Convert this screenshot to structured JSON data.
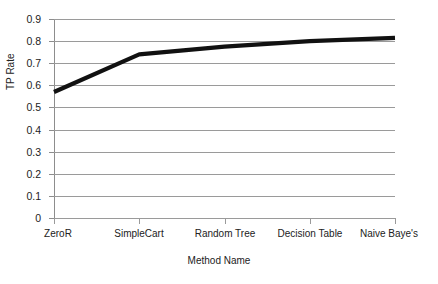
{
  "chart_data": {
    "type": "line",
    "title": "",
    "xlabel": "Method Name",
    "ylabel": "TP Rate",
    "categories": [
      "ZeroR",
      "SimpleCart",
      "Random Tree",
      "Decision Table",
      "Naive Baye's"
    ],
    "values": [
      0.57,
      0.74,
      0.775,
      0.8,
      0.815
    ],
    "ylim": [
      0,
      0.9
    ],
    "yticks": [
      "0",
      "0.1",
      "0.2",
      "0.3",
      "0.4",
      "0.5",
      "0.6",
      "0.7",
      "0.8",
      "0.9"
    ],
    "ytick_values": [
      0,
      0.1,
      0.2,
      0.3,
      0.4,
      0.5,
      0.6,
      0.7,
      0.8,
      0.9
    ],
    "grid": true,
    "legend": false,
    "series": [
      {
        "name": "TP Rate",
        "color": "#111111",
        "values": [
          0.57,
          0.74,
          0.775,
          0.8,
          0.815
        ]
      }
    ]
  },
  "colors": {
    "line": "#111111",
    "grid": "#9a9a9a",
    "axis": "#8d8d8d",
    "background": "#ffffff",
    "text": "#222222"
  }
}
